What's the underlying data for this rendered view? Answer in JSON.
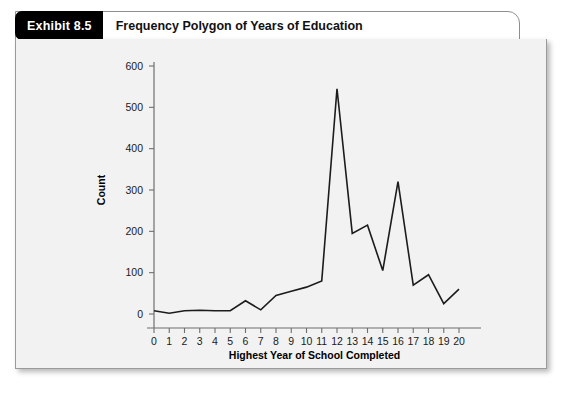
{
  "exhibit": {
    "badge_label": "Exhibit 8.5",
    "title": "Frequency Polygon of Years of Education"
  },
  "chart_data": {
    "type": "line",
    "title": "Frequency Polygon of Years of Education",
    "xlabel": "Highest Year of School Completed",
    "ylabel": "Count",
    "x": [
      0,
      1,
      2,
      3,
      4,
      5,
      6,
      7,
      8,
      9,
      10,
      11,
      12,
      13,
      14,
      15,
      16,
      17,
      18,
      19,
      20
    ],
    "values": [
      8,
      2,
      8,
      9,
      8,
      8,
      32,
      10,
      45,
      55,
      65,
      80,
      545,
      195,
      215,
      105,
      320,
      70,
      95,
      25,
      60
    ],
    "xlim": [
      0,
      20
    ],
    "ylim": [
      0,
      620
    ],
    "xticks": [
      0,
      1,
      2,
      3,
      4,
      5,
      6,
      7,
      8,
      9,
      10,
      11,
      12,
      13,
      14,
      15,
      16,
      17,
      18,
      19,
      20
    ],
    "xtick_labels": [
      "0",
      "1",
      "2",
      "3",
      "4",
      "5",
      "6",
      "7",
      "8",
      "9",
      "10",
      "11",
      "12",
      "13",
      "14",
      "15",
      "16",
      "17",
      "18",
      "19",
      "20"
    ],
    "yticks": [
      0,
      100,
      200,
      300,
      400,
      500,
      600
    ],
    "ytick_labels": [
      "0",
      "100",
      "200",
      "300",
      "400",
      "500",
      "600"
    ],
    "grid": false,
    "legend": false,
    "line_color": "#1c1c1c",
    "plot_background": "#f2f2f2"
  },
  "colors": {
    "badge_background": "#000000",
    "badge_text": "#ffffff",
    "panel_background": "#f2f2f2",
    "panel_border": "#9a9a9a",
    "axis": "#6f6f6f",
    "line": "#1c1c1c"
  }
}
